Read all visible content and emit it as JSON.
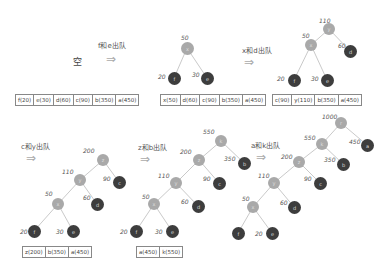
{
  "panels": [
    {
      "id": "p1",
      "empty_label": "空",
      "queue": [
        "f(20)",
        "e(30)",
        "d(60)",
        "c(90)",
        "b(350)",
        "a(450)"
      ]
    },
    {
      "id": "p2",
      "step_label": "f和e出队",
      "tree": {
        "nodes": [
          {
            "id": "x",
            "weight": "50",
            "char": "x",
            "type": "internal"
          },
          {
            "id": "f",
            "weight": "20",
            "char": "f",
            "type": "leaf"
          },
          {
            "id": "e",
            "weight": "30",
            "char": "e",
            "type": "leaf"
          }
        ]
      },
      "queue": [
        "x(50)",
        "d(60)",
        "c(90)",
        "b(350)",
        "a(450)"
      ]
    },
    {
      "id": "p3",
      "step_label": "x和d出队",
      "tree": {
        "nodes": [
          {
            "id": "y",
            "weight": "110",
            "char": "y",
            "type": "internal"
          },
          {
            "id": "x",
            "weight": "50",
            "char": "x",
            "type": "internal"
          },
          {
            "id": "d",
            "weight": "60",
            "char": "d",
            "type": "leaf"
          },
          {
            "id": "f",
            "weight": "20",
            "char": "f",
            "type": "leaf"
          },
          {
            "id": "e",
            "weight": "30",
            "char": "e",
            "type": "leaf"
          }
        ]
      },
      "queue": [
        "c(90)",
        "y(110)",
        "b(350)",
        "a(450)"
      ]
    },
    {
      "id": "p4",
      "step_label": "c和y出队",
      "tree": {
        "nodes": [
          {
            "id": "z",
            "weight": "200",
            "char": "z",
            "type": "internal"
          },
          {
            "id": "y",
            "weight": "110",
            "char": "y",
            "type": "internal"
          },
          {
            "id": "c",
            "weight": "90",
            "char": "c",
            "type": "leaf"
          },
          {
            "id": "x",
            "weight": "50",
            "char": "x",
            "type": "internal"
          },
          {
            "id": "d",
            "weight": "60",
            "char": "d",
            "type": "leaf"
          },
          {
            "id": "f",
            "weight": "20",
            "char": "f",
            "type": "leaf"
          },
          {
            "id": "e",
            "weight": "30",
            "char": "e",
            "type": "leaf"
          }
        ]
      },
      "queue": [
        "z(200)",
        "b(350)",
        "a(450)"
      ]
    },
    {
      "id": "p5",
      "step_label": "z和b出队",
      "tree": {
        "nodes": [
          {
            "id": "k",
            "weight": "550",
            "char": "k",
            "type": "internal"
          },
          {
            "id": "z",
            "weight": "200",
            "char": "z",
            "type": "internal"
          },
          {
            "id": "b",
            "weight": "350",
            "char": "b",
            "type": "leaf"
          },
          {
            "id": "y",
            "weight": "110",
            "char": "y",
            "type": "internal"
          },
          {
            "id": "c",
            "weight": "90",
            "char": "c",
            "type": "leaf"
          },
          {
            "id": "x",
            "weight": "50",
            "char": "x",
            "type": "internal"
          },
          {
            "id": "d",
            "weight": "60",
            "char": "d",
            "type": "leaf"
          },
          {
            "id": "f",
            "weight": "20",
            "char": "f",
            "type": "leaf"
          },
          {
            "id": "e",
            "weight": "30",
            "char": "e",
            "type": "leaf"
          }
        ]
      },
      "queue": [
        "a(450)",
        "k(550)"
      ]
    },
    {
      "id": "p6",
      "step_label": "a和k出队",
      "tree": {
        "nodes": [
          {
            "id": "r",
            "weight": "1000",
            "char": "r",
            "type": "internal"
          },
          {
            "id": "k",
            "weight": "550",
            "char": "k",
            "type": "internal"
          },
          {
            "id": "a",
            "weight": "450",
            "char": "a",
            "type": "leaf"
          },
          {
            "id": "z",
            "weight": "200",
            "char": "z",
            "type": "internal"
          },
          {
            "id": "b",
            "weight": "350",
            "char": "b",
            "type": "leaf"
          },
          {
            "id": "y",
            "weight": "110",
            "char": "y",
            "type": "internal"
          },
          {
            "id": "c",
            "weight": "90",
            "char": "c",
            "type": "leaf"
          },
          {
            "id": "x",
            "weight": "50",
            "char": "x",
            "type": "internal"
          },
          {
            "id": "d",
            "weight": "60",
            "char": "d",
            "type": "leaf"
          },
          {
            "id": "f",
            "weight": "20",
            "char": "f",
            "type": "leaf"
          },
          {
            "id": "e",
            "weight": "20",
            "char": "e",
            "type": "leaf"
          }
        ]
      }
    }
  ],
  "colors": {
    "internal_node": "#a9a9a9",
    "leaf_node": "#3d3d3d",
    "edge": "#bbbbbb"
  }
}
